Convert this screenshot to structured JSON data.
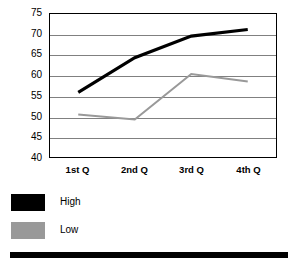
{
  "chart_data": {
    "type": "line",
    "title": "",
    "subtitle": "",
    "xlabel": "",
    "ylabel": "",
    "categories": [
      "1st Q",
      "2nd Q",
      "3rd Q",
      "4th Q"
    ],
    "series": [
      {
        "name": "High",
        "color": "#000000",
        "values": [
          55.8,
          64.3,
          69.6,
          71.2
        ]
      },
      {
        "name": "Low",
        "color": "#999999",
        "values": [
          50.4,
          49.2,
          60.3,
          58.5
        ]
      }
    ],
    "ylim": [
      40,
      75
    ],
    "yticks": [
      40,
      45,
      50,
      55,
      60,
      65,
      70,
      75
    ],
    "ytick_labels": [
      "40",
      "45",
      "50",
      "55",
      "60",
      "65",
      "70",
      "75"
    ],
    "grid": true,
    "grid_axis": "y",
    "legend": true,
    "legend_position": "below-left",
    "plot_border": true,
    "markers": false
  },
  "legend": {
    "entries": [
      {
        "label": "High",
        "color": "#000000"
      },
      {
        "label": "Low",
        "color": "#999999"
      }
    ]
  },
  "colors": {
    "high_series": "#000000",
    "low_series": "#999999",
    "gridline": "#808080",
    "plot_border": "#000000",
    "background": "#ffffff",
    "bottom_bar": "#000000",
    "text": "#000000"
  }
}
